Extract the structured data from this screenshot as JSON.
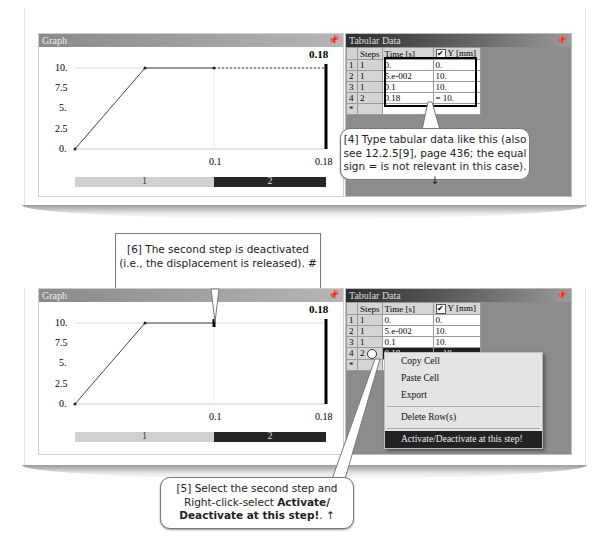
{
  "top": {
    "graph_panel": {
      "title": "Graph",
      "pin_icon": "pin",
      "current_time_label": "0.18",
      "y_ticks": [
        "10.",
        "7.5",
        "5.",
        "2.5",
        "0."
      ],
      "x_ticks": [
        "0.1",
        "0.18"
      ],
      "step_bar": [
        "1",
        "2"
      ]
    },
    "tabular_panel": {
      "title": "Tabular Data",
      "columns": [
        "",
        "Steps",
        "Time [s]",
        "Y [mm]"
      ],
      "rows": [
        {
          "row": "1",
          "step": "1",
          "time": "0.",
          "y": "0."
        },
        {
          "row": "2",
          "step": "1",
          "time": "5.e-002",
          "y": "10."
        },
        {
          "row": "3",
          "step": "1",
          "time": "0.1",
          "y": "10."
        },
        {
          "row": "4",
          "step": "2",
          "time": "0.18",
          "y": "= 10."
        },
        {
          "row": "*",
          "step": "",
          "time": "",
          "y": ""
        }
      ]
    },
    "callout_4": {
      "line1": "[4] Type tabular data like this (also",
      "line2": "see 12.2.5[9], page 436; the equal",
      "line3": "sign = is not relevant in this case). ↓"
    }
  },
  "callout_6": {
    "line1": "[6] The second step is deactivated",
    "line2": "(i.e., the displacement is released).  #"
  },
  "bottom": {
    "graph_panel": {
      "title": "Graph",
      "current_time_label": "0.18",
      "y_ticks": [
        "10.",
        "7.5",
        "5.",
        "2.5",
        "0."
      ],
      "x_ticks": [
        "0.1",
        "0.18"
      ],
      "step_bar": [
        "1",
        "2"
      ]
    },
    "tabular_panel": {
      "title": "Tabular Data",
      "columns": [
        "",
        "Steps",
        "Time [s]",
        "Y [mm]"
      ],
      "rows": [
        {
          "row": "1",
          "step": "1",
          "time": "0.",
          "y": "0."
        },
        {
          "row": "2",
          "step": "1",
          "time": "5.e-002",
          "y": "10."
        },
        {
          "row": "3",
          "step": "1",
          "time": "0.1",
          "y": "10."
        },
        {
          "row": "4",
          "step": "2",
          "time": "0.18",
          "y": "= 10."
        },
        {
          "row": "*",
          "step": "",
          "time": "",
          "y": ""
        }
      ]
    },
    "context_menu": {
      "items": [
        "Copy Cell",
        "Paste Cell",
        "Export",
        "Delete Row(s)",
        "Activate/Deactivate at this step!"
      ]
    }
  },
  "callout_5": {
    "line1": "[5] Select the second step and",
    "line2a": "Right-click-select ",
    "line2b": "Activate/",
    "line3a": "Deactivate at this step!",
    "line3b": ". ↑"
  },
  "colors": {
    "step1_bar": "#d0d0d0",
    "step2_bar": "#262626",
    "panel_gray": "#8c8c8c"
  }
}
